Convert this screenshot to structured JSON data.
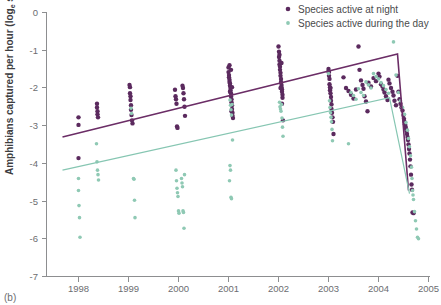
{
  "panel": {
    "label": "(b)"
  },
  "axes": {
    "ylabel_main": "Amphibians captured per hour (log",
    "ylabel_sub": "e",
    "ylabel_tail": " scale)",
    "yticks": [
      "0",
      "-1",
      "-2",
      "-3",
      "-4",
      "-5",
      "-6",
      "-7"
    ],
    "xticks": [
      "1998",
      "1999",
      "2000",
      "2001",
      "2002",
      "2003",
      "2004",
      "2005"
    ]
  },
  "legend": {
    "items": [
      {
        "label": "Species active at night",
        "color": "#5b2a5e",
        "marker": "dot-large"
      },
      {
        "label": "Species active during the day",
        "color": "#8fc9b4",
        "marker": "dot-small"
      }
    ]
  },
  "colors": {
    "night": "#5b2a5e",
    "day": "#8fc9b4",
    "axis": "#8d8e90",
    "text": "#6c6d70",
    "background": "#ffffff"
  },
  "chart_data": {
    "type": "scatter",
    "title": "",
    "xlabel": "",
    "ylabel": "Amphibians captured per hour (log_e scale)",
    "xlim": [
      1997.6,
      2005.2
    ],
    "ylim": [
      -7,
      0
    ],
    "grid": false,
    "legend_position": "top-right",
    "series": [
      {
        "name": "Species active at night",
        "color": "#5b2a5e",
        "marker_size": 2.2,
        "points": [
          [
            1998.0,
            -2.78
          ],
          [
            1998.0,
            -2.98
          ],
          [
            1998.0,
            -3.86
          ],
          [
            1998.37,
            -2.42
          ],
          [
            1998.37,
            -2.52
          ],
          [
            1998.38,
            -2.62
          ],
          [
            1998.38,
            -2.7
          ],
          [
            1998.39,
            -2.78
          ],
          [
            1999.02,
            -1.92
          ],
          [
            1999.03,
            -1.98
          ],
          [
            1999.03,
            -2.14
          ],
          [
            1999.04,
            -2.22
          ],
          [
            1999.04,
            -2.32
          ],
          [
            1999.05,
            -2.46
          ],
          [
            1999.05,
            -2.58
          ],
          [
            1999.06,
            -2.72
          ],
          [
            1999.07,
            -2.86
          ],
          [
            1999.08,
            -2.94
          ],
          [
            1999.93,
            -2.05
          ],
          [
            1999.94,
            -2.22
          ],
          [
            1999.95,
            -2.3
          ],
          [
            1999.96,
            -2.42
          ],
          [
            1999.97,
            -3.02
          ],
          [
            1999.98,
            -3.06
          ],
          [
            2000.08,
            -1.94
          ],
          [
            2000.09,
            -2.0
          ],
          [
            2000.1,
            -2.14
          ],
          [
            2000.11,
            -2.3
          ],
          [
            2000.12,
            -2.5
          ],
          [
            2000.13,
            -2.74
          ],
          [
            2001.0,
            -1.46
          ],
          [
            2001.0,
            -1.58
          ],
          [
            2001.01,
            -1.66
          ],
          [
            2001.01,
            -1.72
          ],
          [
            2001.02,
            -1.78
          ],
          [
            2001.02,
            -1.84
          ],
          [
            2001.03,
            -1.88
          ],
          [
            2001.03,
            -1.94
          ],
          [
            2001.04,
            -2.0
          ],
          [
            2001.04,
            -2.06
          ],
          [
            2001.05,
            -2.14
          ],
          [
            2001.05,
            -2.22
          ],
          [
            2001.06,
            -2.3
          ],
          [
            2001.06,
            -2.38
          ],
          [
            2001.07,
            -2.46
          ],
          [
            2001.07,
            -2.56
          ],
          [
            2001.08,
            -2.66
          ],
          [
            2001.08,
            -2.74
          ],
          [
            2001.09,
            -2.8
          ],
          [
            2001.02,
            -1.4
          ],
          [
            2001.05,
            -1.52
          ],
          [
            2001.07,
            -1.98
          ],
          [
            2001.03,
            -2.1
          ],
          [
            2001.06,
            -2.62
          ],
          [
            2002.0,
            -0.9
          ],
          [
            2002.01,
            -1.04
          ],
          [
            2002.01,
            -1.18
          ],
          [
            2002.02,
            -1.28
          ],
          [
            2002.02,
            -1.38
          ],
          [
            2002.03,
            -1.44
          ],
          [
            2002.03,
            -1.52
          ],
          [
            2002.04,
            -1.6
          ],
          [
            2002.04,
            -1.68
          ],
          [
            2002.05,
            -1.76
          ],
          [
            2002.05,
            -1.84
          ],
          [
            2002.06,
            -1.92
          ],
          [
            2002.06,
            -1.98
          ],
          [
            2002.07,
            -2.04
          ],
          [
            2002.07,
            -2.1
          ],
          [
            2002.08,
            -2.18
          ],
          [
            2002.08,
            -2.26
          ],
          [
            2002.02,
            -1.12
          ],
          [
            2002.06,
            -1.34
          ],
          [
            2002.04,
            -2.0
          ],
          [
            2002.07,
            -2.42
          ],
          [
            2002.09,
            -2.86
          ],
          [
            2003.0,
            -1.5
          ],
          [
            2003.01,
            -1.58
          ],
          [
            2003.01,
            -1.68
          ],
          [
            2003.02,
            -1.76
          ],
          [
            2003.02,
            -1.9
          ],
          [
            2003.03,
            -1.98
          ],
          [
            2003.03,
            -2.06
          ],
          [
            2003.04,
            -2.14
          ],
          [
            2003.05,
            -2.24
          ],
          [
            2003.05,
            -2.34
          ],
          [
            2003.06,
            -2.44
          ],
          [
            2003.06,
            -2.56
          ],
          [
            2003.07,
            -2.66
          ],
          [
            2003.08,
            -2.78
          ],
          [
            2003.09,
            -2.9
          ],
          [
            2003.1,
            -3.22
          ],
          [
            2003.0,
            -1.56
          ],
          [
            2003.04,
            -2.0
          ],
          [
            2003.3,
            -1.72
          ],
          [
            2003.35,
            -2.0
          ],
          [
            2003.4,
            -2.08
          ],
          [
            2003.45,
            -2.18
          ],
          [
            2003.5,
            -2.28
          ],
          [
            2003.55,
            -2.04
          ],
          [
            2003.6,
            -0.9
          ],
          [
            2003.62,
            -1.52
          ],
          [
            2003.65,
            -1.8
          ],
          [
            2003.68,
            -1.92
          ],
          [
            2003.7,
            -2.02
          ],
          [
            2003.72,
            -2.22
          ],
          [
            2003.75,
            -2.36
          ],
          [
            2003.78,
            -2.62
          ],
          [
            2003.8,
            -1.86
          ],
          [
            2003.85,
            -1.96
          ],
          [
            2003.9,
            -1.74
          ],
          [
            2003.95,
            -1.82
          ],
          [
            2004.0,
            -1.62
          ],
          [
            2004.02,
            -1.7
          ],
          [
            2004.05,
            -1.9
          ],
          [
            2004.08,
            -1.96
          ],
          [
            2004.1,
            -2.04
          ],
          [
            2004.12,
            -2.12
          ],
          [
            2004.15,
            -2.22
          ],
          [
            2004.18,
            -2.32
          ],
          [
            2004.2,
            -1.78
          ],
          [
            2004.22,
            -1.88
          ],
          [
            2004.25,
            -2.0
          ],
          [
            2004.28,
            -2.1
          ],
          [
            2004.3,
            -2.2
          ],
          [
            2004.32,
            -2.34
          ],
          [
            2004.35,
            -2.46
          ],
          [
            2004.38,
            -1.68
          ],
          [
            2004.4,
            -2.1
          ],
          [
            2004.42,
            -2.3
          ],
          [
            2004.44,
            -2.42
          ],
          [
            2004.46,
            -2.52
          ],
          [
            2004.48,
            -2.6
          ],
          [
            2004.5,
            -2.72
          ],
          [
            2004.51,
            -2.82
          ],
          [
            2004.52,
            -2.9
          ],
          [
            2004.53,
            -2.96
          ],
          [
            2004.54,
            -3.02
          ],
          [
            2004.55,
            -3.08
          ],
          [
            2004.56,
            -3.14
          ],
          [
            2004.57,
            -3.22
          ],
          [
            2004.58,
            -3.3
          ],
          [
            2004.59,
            -3.38
          ],
          [
            2004.6,
            -3.5
          ],
          [
            2004.61,
            -3.62
          ],
          [
            2004.62,
            -3.74
          ],
          [
            2004.63,
            -3.9
          ],
          [
            2004.64,
            -4.08
          ],
          [
            2004.65,
            -4.3
          ],
          [
            2004.66,
            -4.56
          ],
          [
            2004.67,
            -4.7
          ],
          [
            2004.68,
            -5.3
          ],
          [
            2004.7,
            -5.32
          ]
        ]
      },
      {
        "name": "Species active during the day",
        "color": "#8fc9b4",
        "marker_size": 1.8,
        "points": [
          [
            1998.0,
            -4.4
          ],
          [
            1998.0,
            -4.72
          ],
          [
            1998.01,
            -5.12
          ],
          [
            1998.02,
            -5.44
          ],
          [
            1998.03,
            -5.96
          ],
          [
            1998.36,
            -3.48
          ],
          [
            1998.37,
            -3.96
          ],
          [
            1998.38,
            -4.18
          ],
          [
            1998.39,
            -4.3
          ],
          [
            1998.4,
            -4.44
          ],
          [
            1999.05,
            -2.54
          ],
          [
            1999.06,
            -2.68
          ],
          [
            1999.1,
            -4.4
          ],
          [
            1999.11,
            -4.42
          ],
          [
            1999.12,
            -4.98
          ],
          [
            1999.13,
            -5.44
          ],
          [
            1999.95,
            -4.18
          ],
          [
            1999.96,
            -4.46
          ],
          [
            1999.97,
            -4.66
          ],
          [
            1999.98,
            -4.78
          ],
          [
            1999.99,
            -4.88
          ],
          [
            2000.0,
            -5.26
          ],
          [
            2000.01,
            -5.32
          ],
          [
            2000.06,
            -4.4
          ],
          [
            2000.07,
            -4.52
          ],
          [
            2000.08,
            -4.62
          ],
          [
            2000.09,
            -5.26
          ],
          [
            2000.1,
            -5.3
          ],
          [
            2000.11,
            -5.72
          ],
          [
            2000.12,
            -4.3
          ],
          [
            2001.03,
            -2.32
          ],
          [
            2001.04,
            -2.46
          ],
          [
            2001.05,
            -2.58
          ],
          [
            2001.06,
            -2.72
          ],
          [
            2001.07,
            -2.44
          ],
          [
            2001.08,
            -3.38
          ],
          [
            2001.02,
            -4.46
          ],
          [
            2001.03,
            -4.06
          ],
          [
            2001.04,
            -4.18
          ],
          [
            2001.05,
            -4.9
          ],
          [
            2001.06,
            -4.94
          ],
          [
            2002.02,
            -2.38
          ],
          [
            2002.03,
            -2.5
          ],
          [
            2002.04,
            -2.56
          ],
          [
            2002.05,
            -2.62
          ],
          [
            2002.06,
            -2.44
          ],
          [
            2002.07,
            -2.8
          ],
          [
            2002.08,
            -3.04
          ],
          [
            2002.09,
            -3.28
          ],
          [
            2003.0,
            -1.62
          ],
          [
            2003.02,
            -2.34
          ],
          [
            2003.03,
            -2.52
          ],
          [
            2003.04,
            -2.66
          ],
          [
            2003.05,
            -2.78
          ],
          [
            2003.06,
            -2.9
          ],
          [
            2003.07,
            -3.1
          ],
          [
            2003.08,
            -3.4
          ],
          [
            2003.4,
            -3.48
          ],
          [
            2003.45,
            -2.12
          ],
          [
            2003.5,
            -2.2
          ],
          [
            2003.55,
            -2.3
          ],
          [
            2003.6,
            -2.02
          ],
          [
            2003.65,
            -2.12
          ],
          [
            2003.7,
            -2.2
          ],
          [
            2003.75,
            -1.84
          ],
          [
            2003.8,
            -1.92
          ],
          [
            2003.85,
            -2.0
          ],
          [
            2003.9,
            -1.62
          ],
          [
            2003.95,
            -1.7
          ],
          [
            2004.0,
            -1.76
          ],
          [
            2004.05,
            -1.86
          ],
          [
            2004.1,
            -1.94
          ],
          [
            2004.15,
            -2.04
          ],
          [
            2004.2,
            -2.14
          ],
          [
            2004.3,
            -0.78
          ],
          [
            2004.35,
            -1.66
          ],
          [
            2004.4,
            -2.12
          ],
          [
            2004.44,
            -2.34
          ],
          [
            2004.48,
            -2.52
          ],
          [
            2004.52,
            -2.7
          ],
          [
            2004.55,
            -2.92
          ],
          [
            2004.58,
            -3.12
          ],
          [
            2004.6,
            -3.34
          ],
          [
            2004.62,
            -3.56
          ],
          [
            2004.64,
            -3.8
          ],
          [
            2004.66,
            -4.1
          ],
          [
            2004.67,
            -4.4
          ],
          [
            2004.68,
            -4.72
          ],
          [
            2004.69,
            -4.84
          ],
          [
            2004.7,
            -4.96
          ],
          [
            2004.72,
            -5.28
          ],
          [
            2004.74,
            -5.52
          ],
          [
            2004.76,
            -5.74
          ],
          [
            2004.78,
            -5.96
          ],
          [
            2004.8,
            -6.0
          ]
        ]
      }
    ],
    "trend_lines": [
      {
        "name": "night-trend",
        "color": "#6b2d66",
        "vertices": [
          [
            1997.68,
            -3.3
          ],
          [
            2004.38,
            -1.1
          ],
          [
            2004.6,
            -4.72
          ]
        ]
      },
      {
        "name": "day-trend",
        "color": "#86c6b2",
        "vertices": [
          [
            1997.68,
            -4.18
          ],
          [
            2004.22,
            -2.26
          ],
          [
            2004.62,
            -4.8
          ]
        ]
      }
    ]
  }
}
